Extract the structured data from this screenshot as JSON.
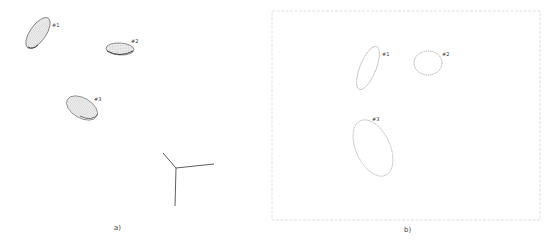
{
  "panels": {
    "a": {
      "caption": "a)",
      "description": "3D ellipsoids with coordinate axes",
      "ellipsoids": [
        {
          "label": "#1",
          "cx": 38,
          "cy": 33,
          "rx": 8,
          "ry": 18,
          "rotate": 35
        },
        {
          "label": "#2",
          "cx": 120,
          "cy": 49,
          "rx": 14,
          "ry": 6,
          "rotate": 3
        },
        {
          "label": "#3",
          "cx": 82,
          "cy": 108,
          "rx": 17,
          "ry": 10,
          "rotate": 30
        }
      ],
      "axes_origin": [
        176,
        168
      ]
    },
    "b": {
      "caption": "b)",
      "description": "2D ellipse projections",
      "frame": {
        "x": 12,
        "y": 11,
        "w": 268,
        "h": 209
      },
      "ellipses": [
        {
          "label": "#1",
          "cx": 108,
          "cy": 68,
          "rx": 8,
          "ry": 23,
          "rotate": 22
        },
        {
          "label": "#2",
          "cx": 168,
          "cy": 63,
          "rx": 14,
          "ry": 12,
          "rotate": 0
        },
        {
          "label": "#3",
          "cx": 113,
          "cy": 147,
          "rx": 17,
          "ry": 30,
          "rotate": -25
        }
      ]
    }
  }
}
